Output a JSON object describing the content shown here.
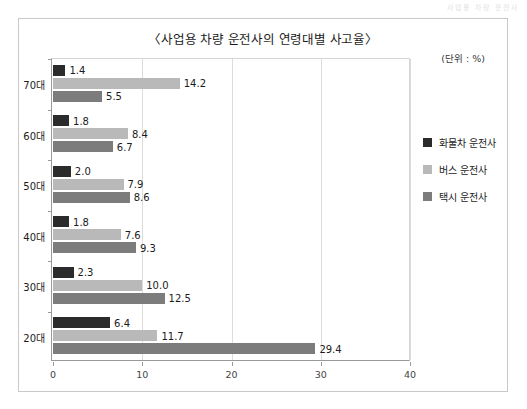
{
  "page": {
    "header_artifact": "사업용 차량 운전사"
  },
  "figure": {
    "title": "〈사업용 차량 운전사의 연령대별 사고율〉",
    "unit_note": "(단위 : %)"
  },
  "legend": {
    "position": "right",
    "items": [
      {
        "label": "화물차 운전사",
        "color": "#2b2b2b"
      },
      {
        "label": "버스 운전사",
        "color": "#b9b9b9"
      },
      {
        "label": "택시 운전사",
        "color": "#7c7c7c"
      }
    ]
  },
  "axes": {
    "x": {
      "ticks": [
        "0",
        "10",
        "20",
        "30",
        "40"
      ],
      "min": 0,
      "max": 40
    },
    "y": {
      "categories": [
        "70대",
        "60대",
        "50대",
        "40대",
        "30대",
        "20대"
      ]
    }
  },
  "chart_data": {
    "type": "bar",
    "orientation": "horizontal",
    "title": "〈사업용 차량 운전사의 연령대별 사고율〉",
    "subtitle": "(단위 : %)",
    "xlabel": "",
    "ylabel": "",
    "xlim": [
      0,
      40
    ],
    "xticks": [
      0,
      10,
      20,
      30,
      40
    ],
    "grid": true,
    "grid_axis": "x",
    "legend_position": "right",
    "categories": [
      "20대",
      "30대",
      "40대",
      "50대",
      "60대",
      "70대"
    ],
    "series": [
      {
        "name": "화물차 운전사",
        "color": "#2b2b2b",
        "values": [
          6.4,
          2.3,
          1.8,
          2.0,
          1.8,
          1.4
        ],
        "labels": [
          "6.4",
          "2.3",
          "1.8",
          "2.0",
          "1.8",
          "1.4"
        ]
      },
      {
        "name": "버스 운전사",
        "color": "#b9b9b9",
        "values": [
          11.7,
          10.0,
          7.6,
          7.9,
          8.4,
          14.2
        ],
        "labels": [
          "11.7",
          "10.0",
          "7.6",
          "7.9",
          "8.4",
          "14.2"
        ]
      },
      {
        "name": "택시 운전사",
        "color": "#7c7c7c",
        "values": [
          29.4,
          12.5,
          9.3,
          8.6,
          6.7,
          5.5
        ],
        "labels": [
          "29.4",
          "12.5",
          "9.3",
          "8.6",
          "6.7",
          "5.5"
        ]
      }
    ]
  },
  "groups": [
    {
      "category": "70대",
      "bars": [
        {
          "series": "화물차 운전사",
          "value": 1.4,
          "label": "1.4",
          "color": "#2b2b2b"
        },
        {
          "series": "버스 운전사",
          "value": 14.2,
          "label": "14.2",
          "color": "#b9b9b9"
        },
        {
          "series": "택시 운전사",
          "value": 5.5,
          "label": "5.5",
          "color": "#7c7c7c"
        }
      ]
    },
    {
      "category": "60대",
      "bars": [
        {
          "series": "화물차 운전사",
          "value": 1.8,
          "label": "1.8",
          "color": "#2b2b2b"
        },
        {
          "series": "버스 운전사",
          "value": 8.4,
          "label": "8.4",
          "color": "#b9b9b9"
        },
        {
          "series": "택시 운전사",
          "value": 6.7,
          "label": "6.7",
          "color": "#7c7c7c"
        }
      ]
    },
    {
      "category": "50대",
      "bars": [
        {
          "series": "화물차 운전사",
          "value": 2.0,
          "label": "2.0",
          "color": "#2b2b2b"
        },
        {
          "series": "버스 운전사",
          "value": 7.9,
          "label": "7.9",
          "color": "#b9b9b9"
        },
        {
          "series": "택시 운전사",
          "value": 8.6,
          "label": "8.6",
          "color": "#7c7c7c"
        }
      ]
    },
    {
      "category": "40대",
      "bars": [
        {
          "series": "화물차 운전사",
          "value": 1.8,
          "label": "1.8",
          "color": "#2b2b2b"
        },
        {
          "series": "버스 운전사",
          "value": 7.6,
          "label": "7.6",
          "color": "#b9b9b9"
        },
        {
          "series": "택시 운전사",
          "value": 9.3,
          "label": "9.3",
          "color": "#7c7c7c"
        }
      ]
    },
    {
      "category": "30대",
      "bars": [
        {
          "series": "화물차 운전사",
          "value": 2.3,
          "label": "2.3",
          "color": "#2b2b2b"
        },
        {
          "series": "버스 운전사",
          "value": 10.0,
          "label": "10.0",
          "color": "#b9b9b9"
        },
        {
          "series": "택시 운전사",
          "value": 12.5,
          "label": "12.5",
          "color": "#7c7c7c"
        }
      ]
    },
    {
      "category": "20대",
      "bars": [
        {
          "series": "화물차 운전사",
          "value": 6.4,
          "label": "6.4",
          "color": "#2b2b2b"
        },
        {
          "series": "버스 운전사",
          "value": 11.7,
          "label": "11.7",
          "color": "#b9b9b9"
        },
        {
          "series": "택시 운전사",
          "value": 29.4,
          "label": "29.4",
          "color": "#7c7c7c"
        }
      ]
    }
  ]
}
